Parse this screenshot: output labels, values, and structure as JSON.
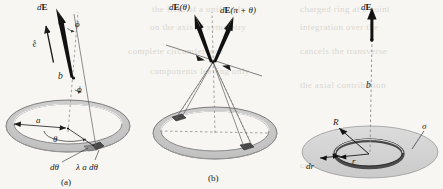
{
  "figure": {
    "background_color": "#f7f6f3",
    "ink_color": "#1b1b1b",
    "ring_fill": "#c9c9c9",
    "ring_stroke": "#6e6e6e",
    "ring_highlight": "#ededed",
    "element_fill": "#4a4a4a",
    "disk_fill": "#d2d2d2",
    "dashed_color": "#8a8a8a"
  },
  "panels": [
    {
      "id": "a",
      "caption": "(a)",
      "description": "Ring of radius a, field point on axis at height b",
      "labels": {
        "field_vector": "dE",
        "unit_vector": "ê",
        "angle_phi_top": "ϕ",
        "angle_phi_bottom": "ϕ",
        "height": "b",
        "radius": "a",
        "angle_theta": "θ",
        "arc_element": "dθ",
        "charge_element": "λ a dθ"
      }
    },
    {
      "id": "b",
      "caption": "(b)",
      "description": "Symmetry: contributions from diametrically opposite elements",
      "labels": {
        "field_left": "dE(θ)",
        "field_right": "dE(π + θ)"
      }
    },
    {
      "id": "c",
      "caption": "",
      "description": "Uniformly charged disk of radius R, surface charge density sigma, annular element of radius r and width dr",
      "labels": {
        "field_vector": "dE",
        "height": "b",
        "disk_radius": "R",
        "surface_charge_density": "σ",
        "ring_width": "dr",
        "ring_radius": "r"
      }
    }
  ],
  "bleed_text": {
    "lines": [
      "the field of a uniformly",
      "charged ring at a point",
      "on the axis of symmetry",
      "integration over the",
      "complete circumference",
      "cancels the transverse",
      "components leaving only",
      "the axial contribution",
      "for the disk we sum over",
      "concentric annular rings"
    ]
  }
}
